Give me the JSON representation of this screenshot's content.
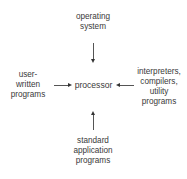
{
  "diagram": {
    "center": {
      "label": "processor"
    },
    "top": {
      "lines": [
        "operating",
        "system"
      ]
    },
    "left": {
      "lines": [
        "user-",
        "written",
        "programs"
      ]
    },
    "right": {
      "lines": [
        "interpreters,",
        "compilers,",
        "utility",
        "programs"
      ]
    },
    "bottom": {
      "lines": [
        "standard",
        "application",
        "programs"
      ]
    },
    "edges": [
      {
        "from": "top",
        "to": "center"
      },
      {
        "from": "left",
        "to": "center"
      },
      {
        "from": "right",
        "to": "center"
      },
      {
        "from": "bottom",
        "to": "center"
      }
    ]
  }
}
